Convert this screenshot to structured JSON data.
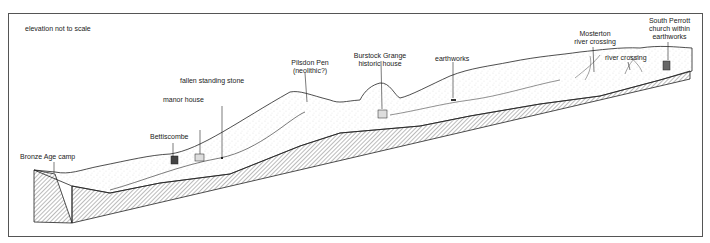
{
  "diagram": {
    "note": "elevation not to scale",
    "labels": {
      "bronze_age_camp": "Bronze Age camp",
      "bettiscombe": "Bettiscombe",
      "manor_house": "manor house",
      "fallen_stone": "fallen standing stone",
      "pilsdon_pen_1": "Pilsdon Pen",
      "pilsdon_pen_2": "(neolithic?)",
      "burstock_1": "Burstock Grange",
      "burstock_2": "historic house",
      "earthworks": "earthworks",
      "mosterton_1": "Mosterton",
      "mosterton_2": "river crossing",
      "river_crossing": "river crossing",
      "south_perrott_1": "South Perrott",
      "south_perrott_2": "church within",
      "south_perrott_3": "earthworks"
    },
    "colors": {
      "line": "#222222",
      "hatch": "#555555",
      "stipple": "#888888",
      "frame": "#555555"
    }
  }
}
